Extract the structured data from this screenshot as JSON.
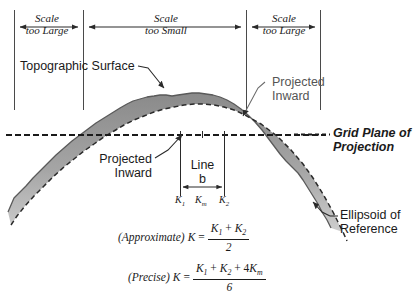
{
  "scale_bands": [
    {
      "line1": "Scale",
      "line2": "too Large"
    },
    {
      "line1": "Scale",
      "line2": "too Small"
    },
    {
      "line1": "Scale",
      "line2": "too Large"
    }
  ],
  "callouts": {
    "topographic_surface": "Topographic Surface",
    "projected_inward_right_line1": "Projected",
    "projected_inward_right_line2": "Inward",
    "projected_inward_left_line1": "Projected",
    "projected_inward_left_line2": "Inward",
    "grid_plane_line1": "Grid Plane of",
    "grid_plane_line2": "Projection",
    "ellipsoid_line1": "Ellipsoid of",
    "ellipsoid_line2": "Reference"
  },
  "line_dimension": {
    "label_line1": "Line",
    "label_line2": "b"
  },
  "k_markers": [
    {
      "symbol": "K",
      "subscript": "1"
    },
    {
      "symbol": "K",
      "subscript": "m"
    },
    {
      "symbol": "K",
      "subscript": "2"
    }
  ],
  "formulas": {
    "approximate": {
      "qualifier": "(Approximate)",
      "lhs": "K",
      "equals": "=",
      "numerator_k1": "K",
      "numerator_k1_sub": "1",
      "numerator_plus": "+",
      "numerator_k2": "K",
      "numerator_k2_sub": "2",
      "denominator": "2"
    },
    "precise": {
      "qualifier": "(Precise)",
      "lhs": "K",
      "equals": "=",
      "numerator_k1": "K",
      "numerator_k1_sub": "1",
      "numerator_plus1": "+",
      "numerator_k2": "K",
      "numerator_k2_sub": "2",
      "numerator_plus2": "+",
      "numerator_coeff": "4",
      "numerator_km": "K",
      "numerator_km_sub": "m",
      "denominator": "6"
    }
  },
  "colors": {
    "ink": "#1a1a1a",
    "terrain_fill_dark": "#8c8c8c",
    "terrain_fill_light": "#c9c9c9",
    "rule": "#4a4a4a"
  }
}
